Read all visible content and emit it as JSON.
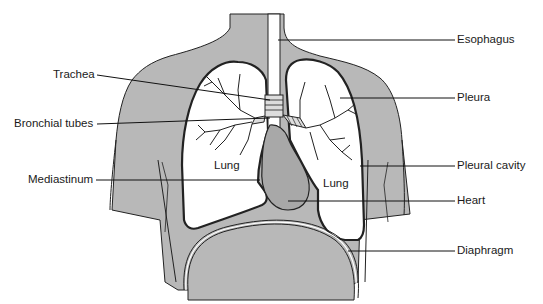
{
  "diagram": {
    "colors": {
      "body_fill": "#b8b8b8",
      "outline": "#222222",
      "background": "#ffffff"
    },
    "labels_left": [
      {
        "id": "trachea",
        "text": "Trachea"
      },
      {
        "id": "bronchial-tubes",
        "text": "Bronchial tubes"
      },
      {
        "id": "mediastinum",
        "text": "Mediastinum"
      }
    ],
    "labels_right": [
      {
        "id": "esophagus",
        "text": "Esophagus"
      },
      {
        "id": "pleura",
        "text": "Pleura"
      },
      {
        "id": "pleural-cavity",
        "text": "Pleural cavity"
      },
      {
        "id": "heart",
        "text": "Heart"
      },
      {
        "id": "diaphragm",
        "text": "Diaphragm"
      }
    ],
    "inner_labels": [
      {
        "id": "left-lung",
        "text": "Lung"
      },
      {
        "id": "right-lung",
        "text": "Lung"
      }
    ]
  }
}
